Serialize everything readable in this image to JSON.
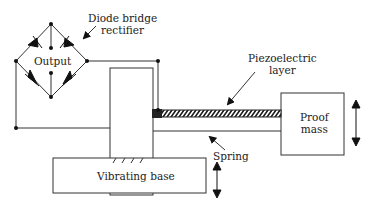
{
  "diagram": {
    "labels": {
      "diode_bridge_line1": "Diode bridge",
      "diode_bridge_line2": "rectifier",
      "output": "Output",
      "piezo_line1": "Piezoelectric",
      "piezo_line2": "layer",
      "proof_mass_line1": "Proof",
      "proof_mass_line2": "mass",
      "spring": "Spring",
      "vibrating_base": "Vibrating base"
    },
    "colors": {
      "line": "#333333",
      "background": "#ffffff"
    }
  }
}
